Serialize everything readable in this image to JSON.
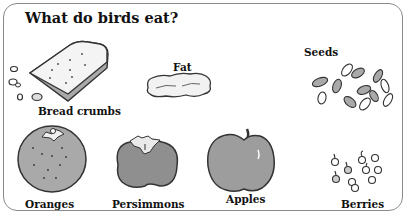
{
  "title": "What do birds eat?",
  "items": [
    {
      "name": "bread-crumbs",
      "label": "Bread crumbs"
    },
    {
      "name": "fat",
      "label": "Fat"
    },
    {
      "name": "seeds",
      "label": "Seeds"
    },
    {
      "name": "oranges",
      "label": "Oranges"
    },
    {
      "name": "persimmons",
      "label": "Persimmons"
    },
    {
      "name": "apples",
      "label": "Apples"
    },
    {
      "name": "berries",
      "label": "Berries"
    }
  ],
  "colors": {
    "fill_gray": "#a9a9a9",
    "fill_light": "#e6e6e6",
    "outline": "#333333",
    "border": "#8a8a8a"
  }
}
